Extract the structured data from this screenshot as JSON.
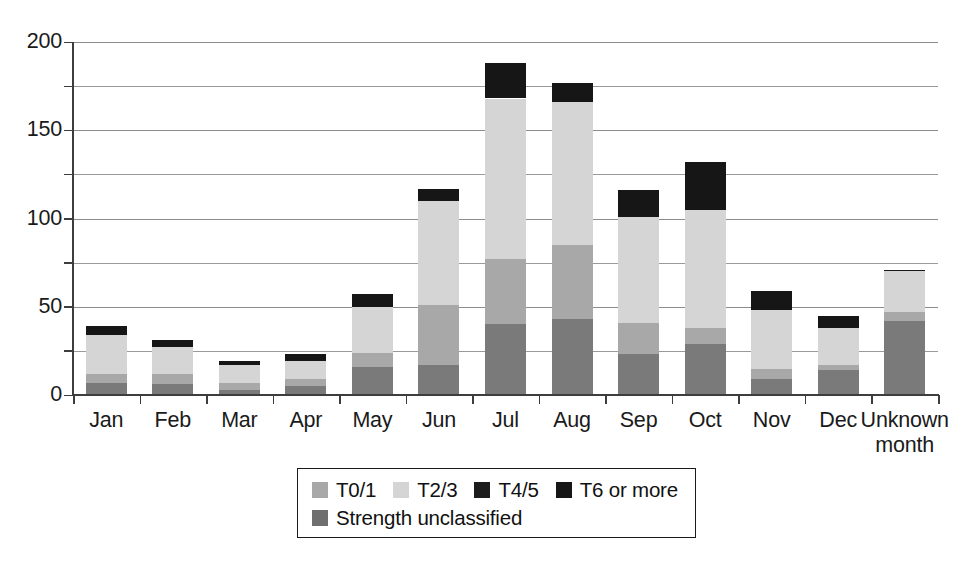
{
  "chart_data": {
    "type": "bar",
    "subtype": "stacked-vertical",
    "title": "",
    "subtitle": "",
    "xlabel": "",
    "ylabel": "",
    "ylim": [
      0,
      200
    ],
    "y_ticks": [
      0,
      50,
      100,
      150,
      200
    ],
    "y_minor_ticks": [
      25,
      75,
      125,
      175
    ],
    "y_tick_labels": [
      "0",
      "50",
      "100",
      "150",
      "200"
    ],
    "grid": "horizontal",
    "legend_position": "bottom-center",
    "categories": [
      "Jan",
      "Feb",
      "Mar",
      "Apr",
      "May",
      "Jun",
      "Jul",
      "Aug",
      "Sep",
      "Oct",
      "Nov",
      "Dec",
      "Unknown month"
    ],
    "category_labels": [
      [
        "Jan"
      ],
      [
        "Feb"
      ],
      [
        "Mar"
      ],
      [
        "Apr"
      ],
      [
        "May"
      ],
      [
        "Jun"
      ],
      [
        "Jul"
      ],
      [
        "Aug"
      ],
      [
        "Sep"
      ],
      [
        "Oct"
      ],
      [
        "Nov"
      ],
      [
        "Dec"
      ],
      [
        "Unknown",
        "month"
      ]
    ],
    "stack_order_bottom_to_top": [
      "Strength unclassified",
      "T0/1",
      "T2/3",
      "T4/5",
      "T6 or more"
    ],
    "series": [
      {
        "name": "Strength unclassified",
        "color": "#7a7a7a",
        "values": [
          7,
          6,
          3,
          5,
          16,
          17,
          40,
          43,
          23,
          29,
          9,
          14,
          42
        ]
      },
      {
        "name": "T0/1",
        "color": "#a8a8a8",
        "values": [
          5,
          6,
          4,
          4,
          8,
          34,
          37,
          42,
          18,
          9,
          6,
          3,
          5
        ]
      },
      {
        "name": "T2/3",
        "color": "#d5d5d5",
        "values": [
          22,
          15,
          10,
          10,
          26,
          59,
          91,
          81,
          60,
          67,
          33,
          21,
          23
        ]
      },
      {
        "name": "T4/5",
        "color": "#1c1c1c",
        "values": [
          0,
          0,
          0,
          0,
          0,
          0,
          0,
          0,
          0,
          0,
          0,
          0,
          0
        ]
      },
      {
        "name": "T6 or more",
        "color": "#161616",
        "values": [
          5,
          4,
          2,
          4,
          7,
          7,
          20,
          11,
          15,
          27,
          11,
          7,
          1
        ]
      }
    ],
    "totals": [
      39,
      31,
      19,
      23,
      57,
      117,
      188,
      177,
      116,
      132,
      59,
      45,
      71
    ]
  },
  "legend": {
    "rows": [
      [
        {
          "label": "T0/1",
          "swatch_color": "#a8a8a8",
          "swatch_name": "legend-swatch-t01"
        },
        {
          "label": "T2/3",
          "swatch_color": "#d5d5d5",
          "swatch_name": "legend-swatch-t23"
        },
        {
          "label": "T4/5",
          "swatch_color": "#1c1c1c",
          "swatch_name": "legend-swatch-t45"
        },
        {
          "label": "T6 or more",
          "swatch_color": "#161616",
          "swatch_name": "legend-swatch-t6"
        }
      ],
      [
        {
          "label": "Strength unclassified",
          "swatch_color": "#6f6f6f",
          "swatch_name": "legend-swatch-unclassified"
        }
      ]
    ]
  },
  "colors": {
    "background": "#ffffff",
    "axis": "#3d3d3d",
    "gridline": "#9a9a9a",
    "text": "#1a1a1a",
    "legend_border": "#1a1a1a"
  }
}
